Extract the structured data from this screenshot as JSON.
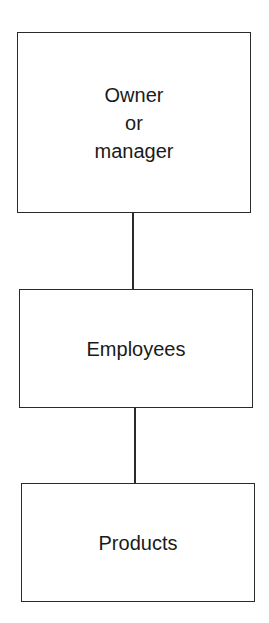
{
  "diagram": {
    "type": "vertical-hierarchy",
    "nodes": [
      {
        "id": "owner",
        "label": "Owner\nor\nmanager"
      },
      {
        "id": "employees",
        "label": "Employees"
      },
      {
        "id": "products",
        "label": "Products"
      }
    ],
    "edges": [
      {
        "from": "owner",
        "to": "employees"
      },
      {
        "from": "employees",
        "to": "products"
      }
    ],
    "colors": {
      "stroke": "#2a2a2a",
      "background": "#ffffff",
      "text": "#1a1a1a"
    }
  }
}
